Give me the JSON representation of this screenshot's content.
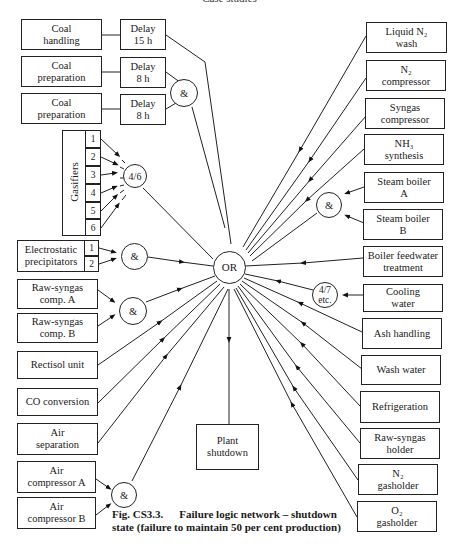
{
  "header": {
    "running_title": "Case studies"
  },
  "diagram": {
    "center_gate": "OR",
    "output": {
      "label": "Plant\nshutdown"
    },
    "left_inputs": {
      "coal_handling": {
        "label": "Coal\nhandling",
        "delay": "Delay\n15 h"
      },
      "coal_prep_1": {
        "label": "Coal\npreparation",
        "delay": "Delay\n8 h"
      },
      "coal_prep_2": {
        "label": "Coal\npreparation",
        "delay": "Delay\n8 h"
      },
      "coal_prep_gate": "&",
      "gasifiers": {
        "label": "Gasifiers",
        "units": [
          "1",
          "2",
          "3",
          "4",
          "5",
          "6"
        ],
        "gate": "4/6"
      },
      "precipitators": {
        "label": "Electrostatic\nprecipitators",
        "units": [
          "1",
          "2"
        ],
        "gate": "&"
      },
      "raw_syngas_a": {
        "label": "Raw-syngas\ncomp. A"
      },
      "raw_syngas_b": {
        "label": "Raw-syngas\ncomp. B"
      },
      "raw_syngas_gate": "&",
      "rectisol": {
        "label": "Rectisol unit"
      },
      "co_conversion": {
        "label": "CO conversion"
      },
      "air_separation": {
        "label": "Air\nseparation"
      },
      "air_comp_a": {
        "label": "Air\ncompressor  A"
      },
      "air_comp_b": {
        "label": "Air\ncompressor  B"
      },
      "air_comp_gate": "&"
    },
    "right_inputs": {
      "liquid_n2_wash": {
        "label": "Liquid N₂\nwash"
      },
      "n2_compressor": {
        "label": "N₂\ncompressor"
      },
      "syngas_compressor": {
        "label": "Syngas\ncompressor"
      },
      "nh3_synthesis": {
        "label": "NH₃\nsynthesis"
      },
      "steam_boiler_a": {
        "label": "Steam boiler\nA"
      },
      "steam_boiler_b": {
        "label": "Steam boiler\nB"
      },
      "steam_boiler_gate": "&",
      "boiler_feedwater": {
        "label": "Boiler feedwater\ntreatment"
      },
      "cooling_water": {
        "label": "Cooling\nwater",
        "gate": "4/7\netc."
      },
      "ash_handling": {
        "label": "Ash handling"
      },
      "wash_water": {
        "label": "Wash water"
      },
      "refrigeration": {
        "label": "Refrigeration"
      },
      "raw_syngas_holder": {
        "label": "Raw-syngas\nholder"
      },
      "n2_gasholder": {
        "label": "N₂\ngasholder"
      },
      "o2_gasholder": {
        "label": "O₂\ngasholder"
      }
    }
  },
  "caption": {
    "figure_number": "Fig.  CS3.3.",
    "line1": "Failure logic network – shutdown",
    "line2": "state (failure to maintain 50 per cent production)"
  }
}
